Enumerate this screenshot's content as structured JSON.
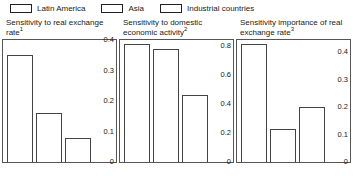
{
  "legend": {
    "items": [
      {
        "label": "Latin America",
        "swatch": "legend-swatch-open-rect"
      },
      {
        "label": "Asia",
        "swatch": "legend-swatch-open-rect"
      },
      {
        "label": "Industrial countries",
        "swatch": "legend-swatch-open-rect"
      }
    ]
  },
  "chart_data": [
    {
      "type": "bar",
      "title": "Sensitivity to real exchange rate",
      "title_footnote": "1",
      "categories": [
        "Latin America",
        "Asia",
        "Industrial countries"
      ],
      "values": [
        0.35,
        0.16,
        0.08
      ],
      "ticks": [
        0,
        0.1,
        0.2,
        0.3,
        0.4
      ],
      "tick_labels": [
        "0",
        "0.1",
        "0.2",
        "0.3",
        "0.4"
      ],
      "ylim": [
        0,
        0.4
      ],
      "xlabel": "",
      "ylabel": "",
      "grid": false,
      "legend_position": "top",
      "axis_side": "right"
    },
    {
      "type": "bar",
      "title": "Sensitivity to domestic economic activity",
      "title_footnote": "2",
      "categories": [
        "Latin America",
        "Asia",
        "Industrial countries"
      ],
      "values": [
        0.81,
        0.78,
        0.46
      ],
      "ticks": [
        0,
        0.2,
        0.4,
        0.6,
        0.8
      ],
      "tick_labels": [
        "0",
        "0.2",
        "0.4",
        "0.6",
        "0.8"
      ],
      "ylim": [
        0,
        0.84
      ],
      "xlabel": "",
      "ylabel": "",
      "grid": false,
      "legend_position": "top",
      "axis_side": "right"
    },
    {
      "type": "bar",
      "title": "Sensitivity importance of real exchange rate",
      "title_footnote": "3",
      "categories": [
        "Latin America",
        "Asia",
        "Industrial countries"
      ],
      "values": [
        0.43,
        0.12,
        0.2
      ],
      "ticks": [
        0,
        0.1,
        0.2,
        0.3,
        0.4
      ],
      "tick_labels": [
        "0",
        "0.1",
        "0.2",
        "0.3",
        "0.4"
      ],
      "ylim": [
        0,
        0.445
      ],
      "xlabel": "",
      "ylabel": "",
      "grid": false,
      "legend_position": "top",
      "axis_side": "right"
    }
  ]
}
